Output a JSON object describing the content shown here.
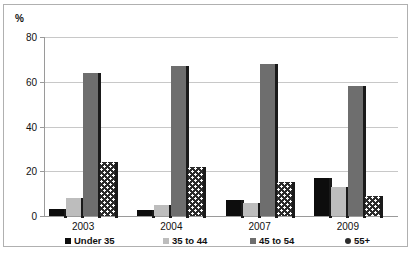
{
  "chart_data": {
    "type": "bar",
    "title": "",
    "subtitle": "",
    "xlabel": "",
    "ylabel": "%",
    "ylim": [
      0,
      80
    ],
    "yticks": [
      0,
      20,
      40,
      60,
      80
    ],
    "ytick_labels": [
      "0",
      "20",
      "40",
      "60",
      "80"
    ],
    "grid": true,
    "legend_position": "bottom",
    "categories": [
      "2003",
      "2004",
      "2007",
      "2009"
    ],
    "series": [
      {
        "name": "Under 35",
        "color": "#0d0d0d",
        "pattern": "solid",
        "values": [
          3,
          2.5,
          7,
          17
        ]
      },
      {
        "name": "35 to 44",
        "color": "#bdbdbd",
        "pattern": "solid",
        "values": [
          8,
          5,
          6,
          13
        ]
      },
      {
        "name": "45 to 54",
        "color": "#6e6e6e",
        "pattern": "solid",
        "values": [
          64,
          67,
          68,
          58
        ]
      },
      {
        "name": "55+",
        "color": "#2b2b2b",
        "pattern": "dots",
        "values": [
          24,
          22,
          15,
          9
        ]
      }
    ]
  },
  "colors": {
    "background": "#ffffff",
    "frame_border": "#b0b0b0",
    "gridline": "#c8c8c8",
    "axis": "#9a9a9a",
    "text": "#111111",
    "series_under35": "#0d0d0d",
    "series_35to44": "#bdbdbd",
    "series_45to54": "#6e6e6e",
    "series_55plus": "#2b2b2b"
  }
}
